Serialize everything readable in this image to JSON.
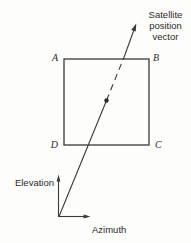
{
  "diagram": {
    "title_label": {
      "line1": "Satellite",
      "line2": "position",
      "line3": "vector"
    },
    "corners": {
      "top_left": "A",
      "top_right": "B",
      "bottom_right": "C",
      "bottom_left": "D"
    },
    "axes": {
      "vertical_label": "Elevation",
      "horizontal_label": "Azimuth"
    }
  },
  "colors": {
    "background": "#fdfdfb",
    "line": "#3a3a3a",
    "text": "#2b2b2b"
  }
}
